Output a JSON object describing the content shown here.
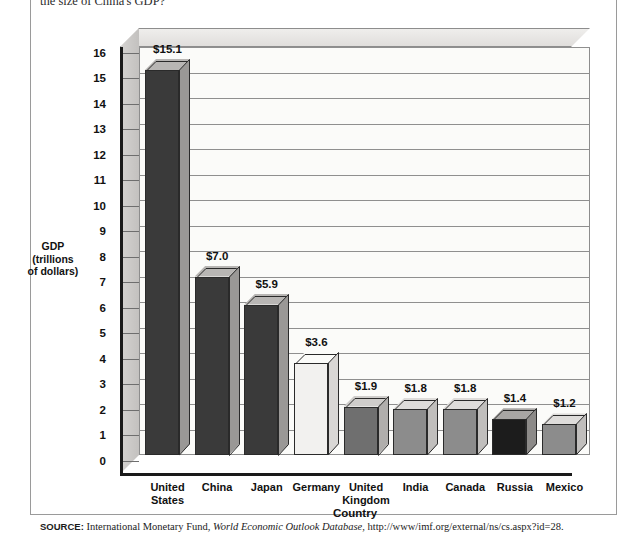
{
  "page": {
    "top_question_fragment": "the size of China's GDP?",
    "source_lead": "SOURCE:",
    "source_text_pre": " International Monetary Fund, ",
    "source_italic": "World Economic Outlook Database",
    "source_text_post": ", http://www/imf.org/external/ns/cs.aspx?id=28."
  },
  "chart_data": {
    "type": "bar",
    "title": "",
    "xlabel": "Country",
    "ylabel": "GDP (trillions of dollars)",
    "ylabel_line1": "GDP",
    "ylabel_line2": "(trillions",
    "ylabel_line3": "of dollars)",
    "ylim": [
      0,
      16
    ],
    "ytick_labels": [
      "16",
      "15",
      "14",
      "13",
      "12",
      "11",
      "10",
      "9",
      "8",
      "7",
      "6",
      "5",
      "4",
      "3",
      "2",
      "1",
      "0"
    ],
    "grid": true,
    "legend": "none",
    "categories": [
      "United States",
      "China",
      "Japan",
      "Germany",
      "United Kingdom",
      "India",
      "Canada",
      "Russia",
      "Mexico"
    ],
    "category_lines": [
      [
        "United",
        "States"
      ],
      [
        "China"
      ],
      [
        "Japan"
      ],
      [
        "Germany"
      ],
      [
        "United",
        "Kingdom"
      ],
      [
        "India"
      ],
      [
        "Canada"
      ],
      [
        "Russia"
      ],
      [
        "Mexico"
      ]
    ],
    "values": [
      15.1,
      7.0,
      5.9,
      3.6,
      1.9,
      1.8,
      1.8,
      1.4,
      1.2
    ],
    "data_labels": [
      "$15.1",
      "$7.0",
      "$5.9",
      "$3.6",
      "$1.9",
      "$1.8",
      "$1.8",
      "$1.4",
      "$1.2"
    ],
    "bar_colors": [
      "#3a3a3a",
      "#3a3a3a",
      "#3a3a3a",
      "#f2f1ef",
      "#6f6f6f",
      "#8c8c8c",
      "#8c8c8c",
      "#1c1c1c",
      "#8c8c8c"
    ],
    "bar_top_colors": [
      "#b8b6b4",
      "#b8b6b4",
      "#b8b6b4",
      "#fbfbf9",
      "#cfcdcb",
      "#dedcda",
      "#dedcda",
      "#a8a6a4",
      "#dedcda"
    ],
    "bar_side_colors": [
      "#9a9896",
      "#9a9896",
      "#9a9896",
      "#d9d7d5",
      "#b0aeac",
      "#c0bebc",
      "#c0bebc",
      "#8c8a88",
      "#c0bebc"
    ]
  }
}
